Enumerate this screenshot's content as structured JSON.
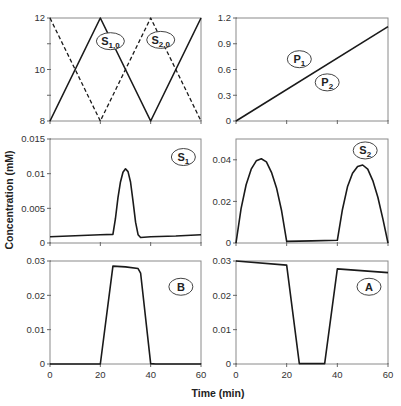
{
  "chart_data": [
    {
      "type": "line",
      "panel": "top-left",
      "title": "",
      "xlabel": "",
      "ylabel": "",
      "xlim": [
        0,
        60
      ],
      "ylim": [
        8,
        12
      ],
      "xticks": [
        0,
        20,
        40,
        60
      ],
      "xtick_labels": [],
      "yticks": [
        8,
        9,
        10,
        11,
        12
      ],
      "ytick_labels": [
        "8",
        "",
        "10",
        "",
        "12"
      ],
      "series": [
        {
          "name": "S1,0",
          "style": "solid",
          "x": [
            0,
            20,
            40,
            60
          ],
          "y": [
            8,
            12,
            8,
            12
          ]
        },
        {
          "name": "S2,0",
          "style": "dashed",
          "x": [
            0,
            20,
            40,
            60
          ],
          "y": [
            12,
            8,
            12,
            8
          ]
        }
      ],
      "annotations": [
        {
          "label": "S",
          "sub": "1,0",
          "x": 24,
          "y": 11.1
        },
        {
          "label": "S",
          "sub": "2,0",
          "x": 44,
          "y": 11.15
        }
      ]
    },
    {
      "type": "line",
      "panel": "top-right",
      "xlim": [
        0,
        60
      ],
      "ylim": [
        0,
        1.2
      ],
      "xticks": [
        0,
        20,
        40,
        60
      ],
      "xtick_labels": [],
      "yticks": [
        0,
        0.3,
        0.6,
        0.9,
        1.2
      ],
      "ytick_labels": [
        "0",
        "0.3",
        "0.6",
        "0.9",
        "1.2"
      ],
      "series": [
        {
          "name": "P1/P2",
          "style": "solid",
          "x": [
            0,
            60
          ],
          "y": [
            0,
            1.1
          ]
        }
      ],
      "annotations": [
        {
          "label": "P",
          "sub": "1",
          "x": 25,
          "y": 0.72
        },
        {
          "label": "P",
          "sub": "2",
          "x": 36,
          "y": 0.45
        }
      ]
    },
    {
      "type": "line",
      "panel": "middle-left",
      "xlim": [
        0,
        60
      ],
      "ylim": [
        0,
        0.015
      ],
      "xticks": [
        0,
        20,
        40,
        60
      ],
      "xtick_labels": [],
      "yticks": [
        0,
        0.005,
        0.01,
        0.015
      ],
      "ytick_labels": [
        "0",
        "0.005",
        "0.01",
        "0.015"
      ],
      "series": [
        {
          "name": "S1",
          "style": "solid",
          "x": [
            0,
            10,
            20,
            25,
            26,
            27,
            28,
            29,
            30,
            31,
            32,
            33,
            34,
            35,
            36,
            40,
            50,
            60
          ],
          "y": [
            0.0009,
            0.00105,
            0.0012,
            0.00125,
            0.0035,
            0.0065,
            0.0088,
            0.0102,
            0.0107,
            0.0103,
            0.0088,
            0.006,
            0.003,
            0.0012,
            0.0008,
            0.0009,
            0.001,
            0.0012
          ]
        }
      ],
      "annotations": [
        {
          "label": "S",
          "sub": "1",
          "x": 53,
          "y": 0.0124
        }
      ]
    },
    {
      "type": "line",
      "panel": "middle-right",
      "xlim": [
        0,
        60
      ],
      "ylim": [
        0,
        0.05
      ],
      "xticks": [
        0,
        20,
        40,
        60
      ],
      "xtick_labels": [],
      "yticks": [
        0,
        0.02,
        0.04
      ],
      "ytick_labels": [
        "0",
        "0.02",
        "0.04"
      ],
      "series": [
        {
          "name": "S2",
          "style": "solid",
          "x": [
            0,
            2,
            4,
            6,
            8,
            10,
            12,
            14,
            16,
            18,
            20,
            30,
            40,
            42,
            44,
            46,
            48,
            50,
            52,
            54,
            56,
            58,
            60
          ],
          "y": [
            0,
            0.0165,
            0.028,
            0.0355,
            0.0395,
            0.0405,
            0.039,
            0.034,
            0.0265,
            0.0155,
            0.0008,
            0.001,
            0.0013,
            0.016,
            0.027,
            0.0335,
            0.0368,
            0.0375,
            0.0355,
            0.03,
            0.022,
            0.0115,
            0
          ]
        }
      ],
      "annotations": [
        {
          "label": "S",
          "sub": "2",
          "x": 51,
          "y": 0.0445
        }
      ]
    },
    {
      "type": "line",
      "panel": "bottom-left",
      "xlim": [
        0,
        60
      ],
      "ylim": [
        0,
        0.03
      ],
      "xticks": [
        0,
        20,
        40,
        60
      ],
      "xtick_labels": [
        "0",
        "20",
        "40",
        "60"
      ],
      "yticks": [
        0,
        0.01,
        0.02,
        0.03
      ],
      "ytick_labels": [
        "0",
        "0.01",
        "0.02",
        "0.03"
      ],
      "series": [
        {
          "name": "B",
          "style": "solid",
          "x": [
            0,
            20,
            25,
            30,
            35,
            36,
            40,
            42,
            60
          ],
          "y": [
            0,
            0,
            0.0285,
            0.0283,
            0.0278,
            0.0265,
            0.0001,
            0,
            0
          ]
        }
      ],
      "annotations": [
        {
          "label": "B",
          "sub": "",
          "x": 52,
          "y": 0.0225
        }
      ]
    },
    {
      "type": "line",
      "panel": "bottom-right",
      "xlim": [
        0,
        60
      ],
      "ylim": [
        0,
        0.03
      ],
      "xticks": [
        0,
        20,
        40,
        60
      ],
      "xtick_labels": [
        "0",
        "20",
        "40",
        "60"
      ],
      "yticks": [
        0,
        0.01,
        0.02,
        0.03
      ],
      "ytick_labels": [
        "0",
        "0.01",
        "0.02",
        "0.03"
      ],
      "series": [
        {
          "name": "A",
          "style": "solid",
          "x": [
            0,
            20,
            25,
            35,
            40,
            60
          ],
          "y": [
            0.03,
            0.0288,
            0.0001,
            0.0001,
            0.0277,
            0.0266
          ]
        }
      ],
      "annotations": [
        {
          "label": "A",
          "sub": "",
          "x": 52.5,
          "y": 0.0225
        }
      ]
    }
  ],
  "labels": {
    "ylabel": "Concentration (mM)",
    "xlabel": "Time (min)"
  }
}
